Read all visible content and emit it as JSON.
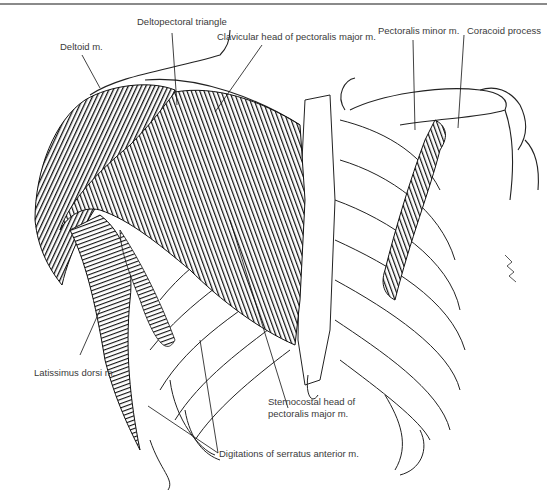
{
  "figure": {
    "labels": {
      "deltopectoral_triangle": "Deltopectoral triangle",
      "deltoid": "Deltoid m.",
      "clavicular_head": "Clavicular head of pectoralis major m.",
      "pectoralis_minor": "Pectoralis minor m.",
      "coracoid_process": "Coracoid process",
      "latissimus_dorsi": "Latissimus dorsi m.",
      "sternocostal_head_line1": "Sternocostal head of",
      "sternocostal_head_line2": "pectoralis major m.",
      "serratus_anterior": "Digitations of serratus anterior m."
    },
    "colors": {
      "ink": "#1a1a1a",
      "muscle": "#2b2b2b",
      "label_text": "#3a3a3a",
      "rule": "#8a8a8a"
    }
  }
}
